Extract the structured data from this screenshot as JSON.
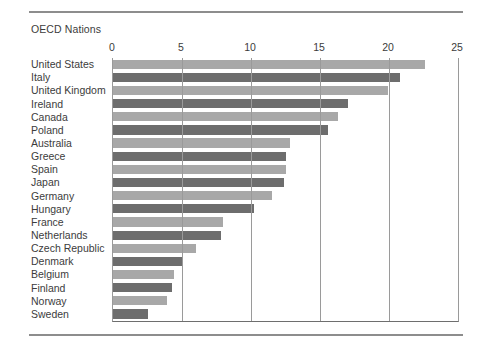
{
  "document": {
    "has_top_rule": true,
    "has_bottom_rule": true,
    "rule_color": "#8d8d8d"
  },
  "chart_data": {
    "type": "bar",
    "orientation": "horizontal",
    "title": "OECD Nations",
    "xlabel": "",
    "ylabel": "",
    "xlim": [
      0,
      25
    ],
    "xticks": [
      0,
      5,
      10,
      15,
      20,
      25
    ],
    "xtick_labels": [
      "0",
      "5",
      "10",
      "15",
      "20",
      "25"
    ],
    "grid": "vertical",
    "legend": "none",
    "bar_colors": [
      "#a8a8a8",
      "#6d6d6d"
    ],
    "bar_color_pattern": "alternating light/dark gray by row",
    "categories": [
      "United States",
      "Italy",
      "United Kingdom",
      "Ireland",
      "Canada",
      "Poland",
      "Australia",
      "Greece",
      "Spain",
      "Japan",
      "Germany",
      "Hungary",
      "France",
      "Netherlands",
      "Czech Republic",
      "Denmark",
      "Belgium",
      "Finland",
      "Norway",
      "Sweden"
    ],
    "values": [
      22.6,
      20.8,
      19.9,
      17.0,
      16.3,
      15.6,
      12.8,
      12.5,
      12.5,
      12.4,
      11.5,
      10.2,
      8.0,
      7.8,
      6.0,
      5.1,
      4.4,
      4.3,
      3.9,
      2.5
    ],
    "series": [
      {
        "name": "OECD Nations",
        "values": [
          22.6,
          20.8,
          19.9,
          17.0,
          16.3,
          15.6,
          12.8,
          12.5,
          12.5,
          12.4,
          11.5,
          10.2,
          8.0,
          7.8,
          6.0,
          5.1,
          4.4,
          4.3,
          3.9,
          2.5
        ]
      }
    ]
  }
}
